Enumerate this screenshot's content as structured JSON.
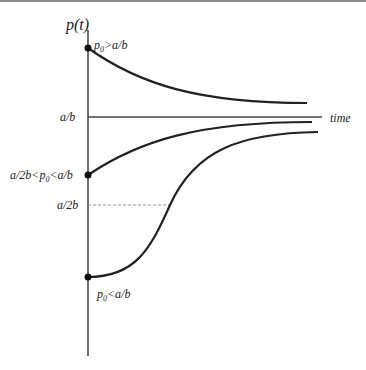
{
  "diagram": {
    "y_axis_label": "p(t)",
    "x_axis_label": "time",
    "levels": {
      "upper": {
        "label": "a/b",
        "style": "solid"
      },
      "half": {
        "label": "a/2b",
        "style": "dashed"
      }
    },
    "curves": [
      {
        "name": "above-equilibrium",
        "initial_label": "p0>a/b",
        "behavior": "decreasing to a/b"
      },
      {
        "name": "between-half-and-equilibrium",
        "initial_label": "a/2b<p0<a/b",
        "behavior": "increasing, concave down, to a/b"
      },
      {
        "name": "below-half",
        "initial_label": "p0<a/b",
        "behavior": "S-shaped, inflection at a/2b, to a/b"
      }
    ]
  },
  "colors": {
    "curve": "#222222",
    "axis": "#333333",
    "dashed": "#888888",
    "top_border": "#8a8a8a"
  }
}
